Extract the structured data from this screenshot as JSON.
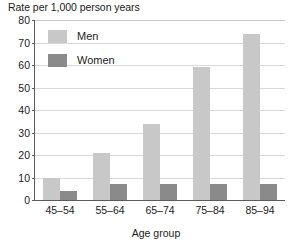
{
  "chart_data": {
    "type": "bar",
    "title": "Rate per 1,000 person years",
    "xlabel": "Age group",
    "ylabel": "Rate per 1,000 person years",
    "categories": [
      "45–54",
      "55–64",
      "65–74",
      "75–84",
      "85–94"
    ],
    "series": [
      {
        "name": "Men",
        "color": "#c8c8c8",
        "values": [
          10,
          21,
          34,
          59,
          74
        ]
      },
      {
        "name": "Women",
        "color": "#8a8a8a",
        "values": [
          4,
          7,
          7,
          7,
          7
        ]
      }
    ],
    "ylim": [
      0,
      80
    ],
    "ytick_values": [
      0,
      10,
      20,
      30,
      40,
      50,
      60,
      70,
      80
    ],
    "ytick_labels": [
      "0",
      "10",
      "20",
      "30",
      "40",
      "50",
      "60",
      "70",
      "80"
    ],
    "grid": true,
    "grid_axis": "y",
    "legend_position": "top-left-inside",
    "legend": [
      "Men",
      "Women"
    ],
    "background": "#ffffff",
    "axis_color": "#5b5b5b",
    "gridline_color": "#d9d9d9"
  }
}
